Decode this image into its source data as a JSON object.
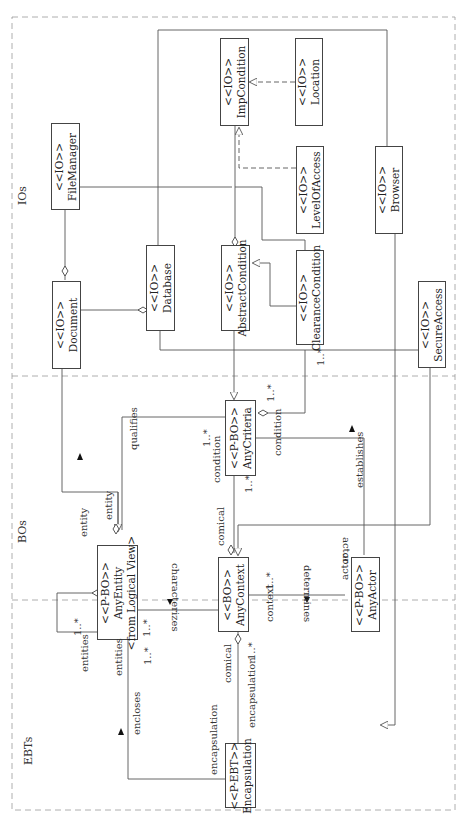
{
  "zones": {
    "ios": "IOs",
    "bos": "BOs",
    "ebts": "EBTs"
  },
  "classes": {
    "imp_condition": {
      "stereotype": "<<IO>>",
      "name": "ImpCondition"
    },
    "location": {
      "stereotype": "<<IO>>",
      "name": "Location"
    },
    "level_of_access": {
      "stereotype": "<<IO>>",
      "name": "LevelOfAccess"
    },
    "browser": {
      "stereotype": "<<IO>>",
      "name": "Browser"
    },
    "file_manager": {
      "stereotype": "<<IO>>",
      "name": "FileManager"
    },
    "document": {
      "stereotype": "<<IO>>",
      "name": "Document"
    },
    "database": {
      "stereotype": "<<IO>>",
      "name": "Database"
    },
    "abstract_condition": {
      "stereotype": "<<IO>>",
      "name": "AbstractCondition"
    },
    "clearance_condition": {
      "stereotype": "<<IO>>",
      "name": "ClearanceCondition"
    },
    "secure_access": {
      "stereotype": "<<IO>>",
      "name": "SecureAccess"
    },
    "any_criteria": {
      "stereotype": "<<P-BO>>",
      "name": "AnyCriteria"
    },
    "any_entity": {
      "stereotype": "<<P-BO>>",
      "name": "AnyEntity",
      "extra": "<from Logical View>"
    },
    "any_context": {
      "stereotype": "<<BO>>",
      "name": "AnyContext"
    },
    "any_actor": {
      "stereotype": "<<P-BO>>",
      "name": "AnyActor"
    },
    "encapsulation": {
      "stereotype": "<<P-EBT>>",
      "name": "Encapsulation"
    }
  },
  "labels": {
    "qualifies": "qualifies",
    "entity_1": "entity",
    "entity_2": "entity",
    "condition_1": "condition",
    "condition_2": "condition",
    "mult_criteria_top": "1..*",
    "mult_criteria_left": "1..*",
    "mult_criteria_bottom": "1..*",
    "mult_clearance": "1..*",
    "establishes": "establishes",
    "actor_1": "actor",
    "actor_2": "actor",
    "comical_1": "comical",
    "comical_2": "comical",
    "characterizes": "characterizes",
    "mult_entity_right": "1..*",
    "mult_entity_self": "1..*",
    "mult_entity_bottom": "1..*",
    "entities_1": "entities",
    "entities_2": "entities",
    "determines": "determines",
    "context": "context",
    "mult_context": "1..*",
    "mult_context_bottom": "1..*",
    "encapsulation_1": "encapsulation",
    "encapsulation_2": "encapsulation",
    "encloses": "encloses"
  }
}
